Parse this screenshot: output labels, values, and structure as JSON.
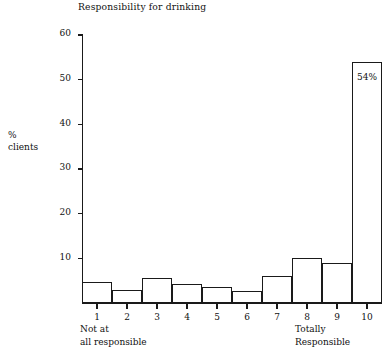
{
  "chart_data": {
    "type": "bar",
    "title": "Responsibility for drinking",
    "xlabel": "",
    "ylabel": "% clients",
    "ylabel_lines": [
      "%",
      "clients"
    ],
    "categories": [
      "1",
      "2",
      "3",
      "4",
      "5",
      "6",
      "7",
      "8",
      "9",
      "10"
    ],
    "values": [
      4.8,
      3,
      5.5,
      4.3,
      3.5,
      2.8,
      6,
      10,
      9,
      54
    ],
    "data_labels": [
      "",
      "",
      "",
      "",
      "",
      "",
      "",
      "",
      "",
      "54%"
    ],
    "ylim": [
      0,
      60
    ],
    "yticks": [
      10,
      20,
      30,
      40,
      50,
      60
    ],
    "ytick_labels": [
      "10",
      "20",
      "30",
      "40",
      "50",
      "60"
    ],
    "grid": false,
    "legend": false,
    "bar_style": "outlined-histogram",
    "axis_endpoint_labels": {
      "left_lines": [
        "Not at",
        "all responsible"
      ],
      "right_lines": [
        "Totally",
        "Responsible"
      ]
    },
    "colors": {
      "bar_fill": "#ffffff",
      "bar_stroke": "#1a1a1a",
      "axis": "#1a1a1a",
      "text": "#111111",
      "background": "#ffffff"
    }
  }
}
